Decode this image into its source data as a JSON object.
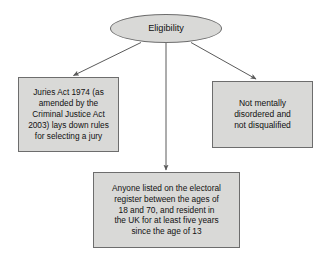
{
  "diagram": {
    "title": "Eligibility",
    "type": "flowchart",
    "colors": {
      "node_fill": "#d9d9d7",
      "node_border": "#6d6d6d",
      "arrow": "#5a5a5a",
      "background": "#ffffff",
      "text": "#111111"
    },
    "root": {
      "label": "Eligibility",
      "shape": "ellipse"
    },
    "nodes": [
      {
        "id": "juries-act",
        "shape": "rectangle",
        "label": "Juries Act 1974 (as\namended by the\nCriminal Justice Act\n2003) lays down rules\nfor selecting a jury"
      },
      {
        "id": "electoral-register",
        "shape": "rectangle",
        "label": "Anyone listed on the electoral\nregister between the ages of\n18 and 70, and resident in\nthe UK for at least five years\nsince the age of 13"
      },
      {
        "id": "not-disqualified",
        "shape": "rectangle",
        "label": "Not mentally\ndisordered and\nnot disqualified"
      }
    ],
    "edges": [
      {
        "from": "Eligibility",
        "to": "juries-act",
        "style": "arrow"
      },
      {
        "from": "Eligibility",
        "to": "electoral-register",
        "style": "arrow"
      },
      {
        "from": "Eligibility",
        "to": "not-disqualified",
        "style": "arrow"
      }
    ]
  }
}
